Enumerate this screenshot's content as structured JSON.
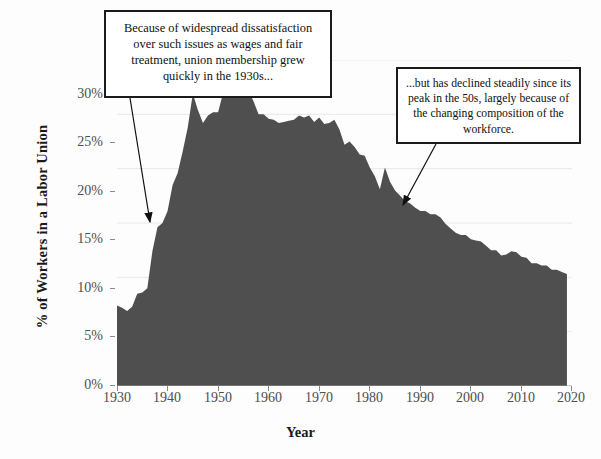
{
  "figure": {
    "ylabel": "% of Workers in a Labor Union",
    "xlabel": "Year"
  },
  "annotations": {
    "left_box": "Because of widespread dissatisfaction over such issues as wages and fair treatment, union membership grew quickly in the 1930s...",
    "right_box": "...but has declined steadily since its peak in the 50s, largely because of the changing composition of the workforce."
  },
  "colors": {
    "area_fill": "#4f4f4f",
    "grid": "#e8e8e8",
    "axis": "#9a9a9a",
    "tick_text": "#4e4e4e",
    "title_text": "#1a1a1a",
    "callout_border": "#1b1b1b"
  },
  "chart_data": {
    "type": "area",
    "title": "",
    "xlabel": "Year",
    "ylabel": "% of Workers in a Labor Union",
    "xlim": [
      1930,
      2020
    ],
    "ylim": [
      0,
      30
    ],
    "grid": true,
    "legend": "none",
    "xticks": [
      1930,
      1940,
      1950,
      1960,
      1970,
      1980,
      1990,
      2000,
      2010,
      2020
    ],
    "xtick_labels": [
      "1930",
      "1940",
      "1950",
      "1960",
      "1970",
      "1980",
      "1990",
      "2000",
      "2010",
      "2020"
    ],
    "yticks": [
      0,
      5,
      10,
      15,
      20,
      25,
      30
    ],
    "ytick_labels": [
      "0%",
      "5%",
      "10%",
      "15%",
      "20%",
      "25%",
      "30%"
    ],
    "series_name": "Union membership rate",
    "x": [
      1930,
      1931,
      1932,
      1933,
      1934,
      1935,
      1936,
      1937,
      1938,
      1939,
      1940,
      1941,
      1942,
      1943,
      1944,
      1945,
      1946,
      1947,
      1948,
      1949,
      1950,
      1951,
      1952,
      1953,
      1954,
      1955,
      1956,
      1957,
      1958,
      1959,
      1960,
      1961,
      1962,
      1963,
      1964,
      1965,
      1966,
      1967,
      1968,
      1969,
      1970,
      1971,
      1972,
      1973,
      1974,
      1975,
      1976,
      1977,
      1978,
      1979,
      1980,
      1981,
      1982,
      1983,
      1984,
      1985,
      1986,
      1987,
      1988,
      1989,
      1990,
      1991,
      1992,
      1993,
      1994,
      1995,
      1996,
      1997,
      1998,
      1999,
      2000,
      2001,
      2002,
      2003,
      2004,
      2005,
      2006,
      2007,
      2008,
      2009,
      2010,
      2011,
      2012,
      2013,
      2014,
      2015,
      2016,
      2017,
      2018,
      2019
    ],
    "values": [
      7.4,
      7.2,
      6.9,
      7.3,
      8.5,
      8.6,
      9.0,
      12.4,
      14.6,
      15.0,
      16.1,
      18.5,
      19.6,
      21.6,
      23.8,
      26.9,
      25.4,
      24.2,
      24.9,
      25.2,
      25.2,
      27.0,
      27.1,
      27.9,
      27.6,
      27.6,
      27.2,
      26.2,
      25.0,
      25.0,
      24.6,
      24.5,
      24.2,
      24.3,
      24.4,
      24.5,
      24.9,
      24.7,
      24.9,
      24.3,
      24.7,
      24.1,
      24.2,
      24.5,
      23.6,
      22.2,
      22.5,
      22.0,
      21.3,
      21.2,
      20.1,
      19.3,
      18.1,
      20.1,
      18.8,
      18.0,
      17.5,
      17.0,
      16.8,
      16.4,
      16.1,
      16.1,
      15.8,
      15.8,
      15.5,
      14.9,
      14.5,
      14.1,
      13.9,
      13.9,
      13.5,
      13.4,
      13.3,
      12.9,
      12.5,
      12.5,
      12.0,
      12.1,
      12.4,
      12.3,
      11.9,
      11.8,
      11.3,
      11.3,
      11.1,
      11.1,
      10.7,
      10.7,
      10.5,
      10.3
    ]
  }
}
